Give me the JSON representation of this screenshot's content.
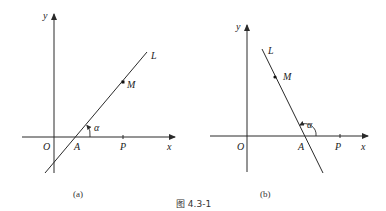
{
  "figure": {
    "label": "图 4.3-1",
    "panels": [
      {
        "id": "a",
        "caption": "(a)",
        "axes": {
          "x_label": "x",
          "y_label": "y",
          "origin_label": "O"
        },
        "line_label": "L",
        "points": {
          "M": "M",
          "A": "A",
          "P": "P"
        },
        "angle_label": "α",
        "description": "Line L with positive slope crossing x-axis at A; inclination angle α acute"
      },
      {
        "id": "b",
        "caption": "(b)",
        "axes": {
          "x_label": "x",
          "y_label": "y",
          "origin_label": "O"
        },
        "line_label": "L",
        "points": {
          "M": "M",
          "A": "A",
          "P": "P"
        },
        "angle_label": "α",
        "description": "Line L with negative slope crossing x-axis at A; inclination angle α obtuse"
      }
    ]
  },
  "colors": {
    "stroke": "#2a2a2a",
    "text": "#222222",
    "background": "#ffffff"
  }
}
